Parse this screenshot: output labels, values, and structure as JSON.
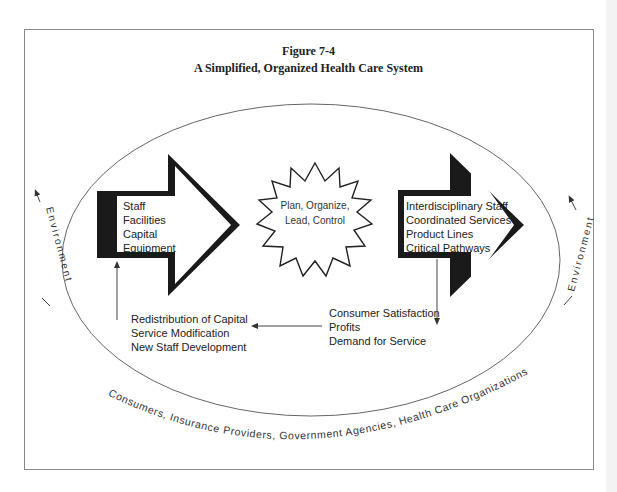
{
  "figure": {
    "number": "Figure 7-4",
    "title": "A Simplified, Organized Health Care System"
  },
  "inputs_arrow": {
    "items": [
      "Staff",
      "Facilities",
      "Capital",
      "Equipment"
    ]
  },
  "process_star": {
    "lines": [
      "Plan, Organize,",
      "Lead, Control"
    ]
  },
  "outputs_arrow": {
    "items": [
      "Interdisciplinary Staff",
      "Coordinated Services",
      "Product Lines",
      "Critical Pathways"
    ]
  },
  "outcomes": {
    "items": [
      "Consumer Satisfaction",
      "Profits",
      "Demand for Service"
    ]
  },
  "feedback": {
    "items": [
      "Redistribution of Capital",
      "Service Modification",
      "New Staff Development"
    ]
  },
  "environment": {
    "left_label": "Environment",
    "right_label": "Environment",
    "stakeholders": "Consumers,   Insurance Providers,   Government Agencies,   Health Care Organizations"
  },
  "colors": {
    "arrow_fill": "#1a1a1a",
    "line": "#555555",
    "text": "#222222"
  }
}
